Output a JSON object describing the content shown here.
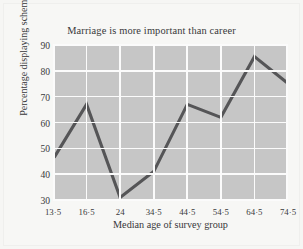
{
  "chart_data": {
    "type": "line",
    "title": "Marriage is more important than career",
    "xlabel": "Median age of survey group",
    "ylabel": "Percentage displaying schema",
    "categories": [
      "13.5",
      "16.5",
      "24",
      "34.5",
      "44.5",
      "54.5",
      "64.5",
      "74.5"
    ],
    "x_tick_labels": [
      "13·5",
      "16·5",
      "24",
      "34·5",
      "44·5",
      "54·5",
      "64·5",
      "74·5"
    ],
    "values": [
      46.5,
      67,
      31,
      41,
      67,
      62,
      85.5,
      75.5
    ],
    "y_ticks": [
      30,
      40,
      50,
      60,
      70,
      80,
      90
    ],
    "y_tick_labels": [
      "30",
      "40",
      "50",
      "60",
      "70",
      "80",
      "90"
    ],
    "ylim": [
      30,
      90
    ],
    "xlim": [
      0,
      7
    ],
    "grid": true,
    "legend": "none",
    "series": [
      {
        "name": "Percentage displaying schema",
        "values": [
          46.5,
          67,
          31,
          41,
          67,
          62,
          85.5,
          75.5
        ]
      }
    ],
    "colors": {
      "plot_background": "#c6c6c6",
      "gridline": "#fbfbfb",
      "line": "#555557",
      "page_background": "#f6f6f4",
      "text": "#38383a"
    }
  }
}
